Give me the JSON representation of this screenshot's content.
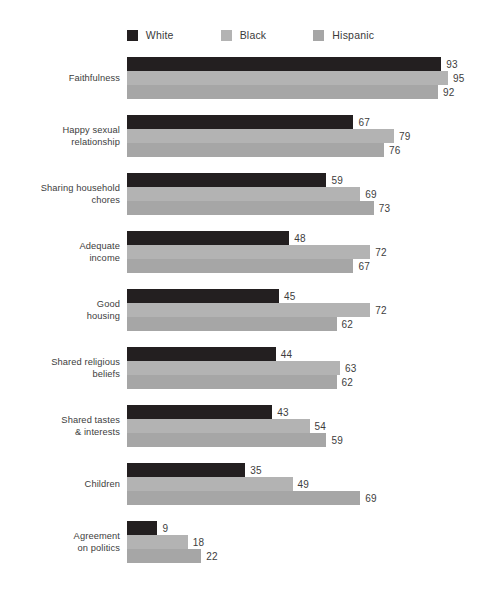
{
  "legend": {
    "position": "top-center",
    "entries": [
      {
        "label": "White",
        "color": "#231f20",
        "swatch_name": "legend-swatch-white"
      },
      {
        "label": "Black",
        "color": "#b3b3b3",
        "swatch_name": "legend-swatch-black"
      },
      {
        "label": "Hispanic",
        "color": "#a6a6a6",
        "swatch_name": "legend-swatch-hispanic"
      }
    ]
  },
  "chart_data": {
    "type": "bar",
    "orientation": "horizontal",
    "title": "",
    "subtitle": "",
    "xlabel": "",
    "ylabel": "",
    "xlim": [
      0,
      100
    ],
    "grid": false,
    "legend_position": "top-center",
    "categories": [
      "Faithfulness",
      "Happy sexual relationship",
      "Sharing household chores",
      "Adequate income",
      "Good housing",
      "Shared religious beliefs",
      "Shared tastes & interests",
      "Children",
      "Agreement on politics"
    ],
    "category_lines": [
      [
        "Faithfulness"
      ],
      [
        "Happy sexual",
        "relationship"
      ],
      [
        "Sharing household",
        "chores"
      ],
      [
        "Adequate",
        "income"
      ],
      [
        "Good",
        "housing"
      ],
      [
        "Shared religious",
        "beliefs"
      ],
      [
        "Shared tastes",
        "& interests"
      ],
      [
        "Children"
      ],
      [
        "Agreement",
        "on politics"
      ]
    ],
    "series": [
      {
        "name": "White",
        "color": "#231f20",
        "values": [
          93,
          67,
          59,
          48,
          45,
          44,
          43,
          35,
          9
        ]
      },
      {
        "name": "Black",
        "color": "#b3b3b3",
        "values": [
          95,
          79,
          69,
          72,
          72,
          63,
          54,
          49,
          18
        ]
      },
      {
        "name": "Hispanic",
        "color": "#a6a6a6",
        "values": [
          92,
          76,
          73,
          67,
          62,
          62,
          59,
          69,
          22
        ]
      }
    ]
  },
  "scale": {
    "px_per_unit": 3.38,
    "bar_origin_x": 127
  }
}
